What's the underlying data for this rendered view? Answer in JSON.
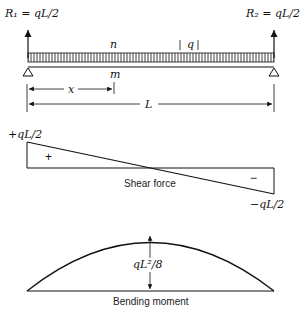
{
  "beam": {
    "left_reaction": "R₁ = qL/2",
    "right_reaction": "R₂ = qL/2",
    "load_label": "q",
    "top_point": "n",
    "bottom_point": "m",
    "x_dim": "x",
    "length_dim": "L"
  },
  "shear": {
    "max_label": "+qL/2",
    "min_label": "−qL/2",
    "positive_sign": "+",
    "negative_sign": "−",
    "caption": "Shear force"
  },
  "moment": {
    "peak_label": "qL²/8",
    "caption": "Bending moment"
  },
  "colors": {
    "ink": "#111111",
    "background": "#ffffff"
  }
}
